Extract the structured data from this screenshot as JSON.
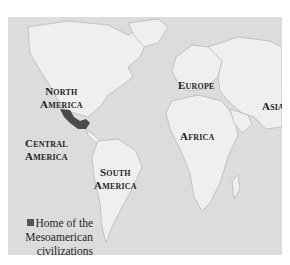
{
  "map": {
    "title": "World map showing the Home of the Mesoamerican civilizations",
    "colors": {
      "ocean": "#dcdcdc",
      "land": "#efefef",
      "coast": "#b9b9b9",
      "highlight": "#4a4a4a",
      "text": "#1e1e1e"
    },
    "labels": {
      "north_america": [
        "North",
        "America"
      ],
      "central_america": [
        "Central",
        "America"
      ],
      "south_america": [
        "South",
        "America"
      ],
      "europe": "Europe",
      "africa": "Africa",
      "asia": "Asia"
    },
    "legend": {
      "swatch_color": "#555555",
      "lines": [
        "Home of the",
        "Mesoamerican",
        "civilizations"
      ]
    }
  }
}
